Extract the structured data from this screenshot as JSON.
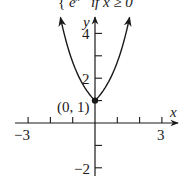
{
  "formula_fragment": {
    "brace": "{",
    "expr": "e",
    "sup": "x",
    "condition": "if x ≥ 0"
  },
  "chart_data": {
    "type": "line",
    "title": "",
    "function": "piecewise: e^(-x) if x < 0, e^x if x ≥ 0 (e^|x|)",
    "xlabel": "x",
    "ylabel": "y",
    "xlim": [
      -3.5,
      3.7
    ],
    "ylim": [
      -2.3,
      4.8
    ],
    "grid": false,
    "x_ticks": [
      -3,
      -2,
      -1,
      1,
      2,
      3
    ],
    "x_tick_labels": {
      "-3": "−3",
      "3": "3"
    },
    "y_ticks": [
      -2,
      -1,
      1,
      2,
      3,
      4
    ],
    "y_tick_labels": {
      "-2": "−2",
      "2": "2",
      "4": "4"
    },
    "annotations": [
      {
        "x": 0,
        "y": 1,
        "label": "(0, 1)",
        "marker": "filled-dot"
      }
    ],
    "series": [
      {
        "name": "f(x)",
        "x": [
          -1.55,
          -1.2,
          -0.8,
          -0.4,
          0,
          0.4,
          0.8,
          1.2,
          1.55
        ],
        "values": [
          4.71,
          3.32,
          2.23,
          1.49,
          1,
          1.49,
          2.23,
          3.32,
          4.71
        ],
        "arrows_at_ends": true
      }
    ]
  },
  "labels": {
    "x_axis": "x",
    "y_axis": "y",
    "tick_neg3": "−3",
    "tick_3": "3",
    "tick_4": "4",
    "tick_2": "2",
    "tick_neg2": "−2",
    "point": "(0, 1)"
  }
}
